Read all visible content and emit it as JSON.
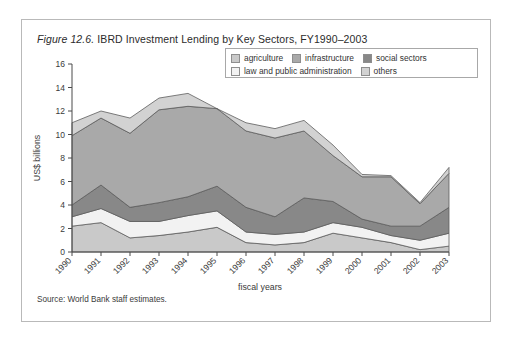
{
  "figure": {
    "label": "Figure 12.6.",
    "title": "IBRD Investment Lending by Key Sectors, FY1990–2003",
    "source": "Source: World Bank staff estimates."
  },
  "legend": {
    "row1": [
      {
        "label": "agriculture",
        "color": "#c9c9c9",
        "key": "agriculture"
      },
      {
        "label": "infrastructure",
        "color": "#a9a9a9",
        "key": "infrastructure"
      },
      {
        "label": "social sectors",
        "color": "#888888",
        "key": "social_sectors"
      }
    ],
    "row2": [
      {
        "label": "law and public administration",
        "color": "#f2f2f2",
        "key": "law_and_public_administration"
      },
      {
        "label": "others",
        "color": "#d2d2d2",
        "key": "others"
      }
    ]
  },
  "axes": {
    "y_label": "US$ billions",
    "x_label": "fiscal years",
    "y_ticks": [
      "0",
      "2",
      "4",
      "6",
      "8",
      "10",
      "12",
      "14",
      "16"
    ],
    "x_ticks": [
      "1990",
      "1991",
      "1992",
      "1993",
      "1994",
      "1995",
      "1996",
      "1997",
      "1998",
      "1999",
      "2000",
      "2001",
      "2002",
      "2003"
    ]
  },
  "chart_data": {
    "type": "area",
    "stacked": true,
    "title": "Figure 12.6. IBRD Investment Lending by Key Sectors, FY1990–2003",
    "xlabel": "fiscal years",
    "ylabel": "US$ billions",
    "ylim": [
      0,
      16
    ],
    "ytick_step": 2,
    "grid": false,
    "legend_position": "top-right-inside",
    "categories": [
      "1990",
      "1991",
      "1992",
      "1993",
      "1994",
      "1995",
      "1996",
      "1997",
      "1998",
      "1999",
      "2000",
      "2001",
      "2002",
      "2003"
    ],
    "stack_order_bottom_to_top": [
      "agriculture",
      "law and public administration",
      "social sectors",
      "infrastructure",
      "others"
    ],
    "series": [
      {
        "name": "agriculture",
        "color": "#c9c9c9",
        "values": [
          2.2,
          2.5,
          1.2,
          1.4,
          1.7,
          2.1,
          0.8,
          0.6,
          0.8,
          1.6,
          1.2,
          0.8,
          0.2,
          0.5
        ]
      },
      {
        "name": "law and public administration",
        "color": "#f2f2f2",
        "values": [
          0.8,
          1.2,
          1.4,
          1.2,
          1.4,
          1.4,
          0.9,
          0.9,
          0.9,
          0.9,
          0.9,
          0.6,
          0.8,
          1.1
        ]
      },
      {
        "name": "social sectors",
        "color": "#888888",
        "values": [
          1.0,
          2.0,
          1.2,
          1.6,
          1.6,
          2.1,
          2.1,
          1.5,
          2.9,
          1.8,
          0.7,
          0.8,
          1.2,
          2.2
        ]
      },
      {
        "name": "infrastructure",
        "color": "#a9a9a9",
        "values": [
          5.9,
          5.7,
          6.3,
          7.9,
          7.7,
          6.6,
          6.5,
          6.7,
          5.7,
          3.9,
          3.6,
          4.2,
          1.9,
          2.9
        ]
      },
      {
        "name": "others",
        "color": "#d2d2d2",
        "values": [
          1.1,
          0.6,
          1.3,
          1.0,
          1.1,
          0.0,
          0.7,
          0.8,
          0.9,
          0.9,
          0.2,
          0.1,
          0.1,
          0.5
        ]
      }
    ],
    "cumulative_totals": [
      11.0,
      12.0,
      11.4,
      13.1,
      13.5,
      12.2,
      11.0,
      10.5,
      11.2,
      9.1,
      6.6,
      6.5,
      4.2,
      7.2
    ]
  }
}
